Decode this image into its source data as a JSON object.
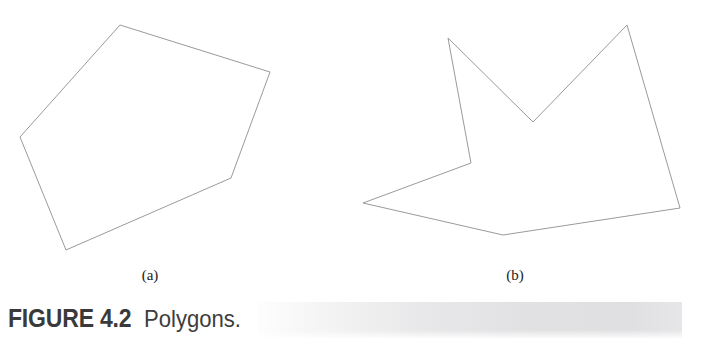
{
  "figure": {
    "caption_label": "FIGURE 4.2",
    "caption_text": "Polygons.",
    "line_color": "#9a9a9a",
    "line_width": 1,
    "background_color": "#ffffff",
    "band_color": "#e4e4e6"
  },
  "panels": [
    {
      "id": "a",
      "label": "(a)",
      "name": "convex-polygon",
      "vertex_count": 5,
      "points": "120,25 270,72 231,178 66,250 20,137",
      "vertices": [
        {
          "x": 120,
          "y": 25
        },
        {
          "x": 270,
          "y": 72
        },
        {
          "x": 231,
          "y": 178
        },
        {
          "x": 66,
          "y": 250
        },
        {
          "x": 20,
          "y": 137
        }
      ]
    },
    {
      "id": "b",
      "label": "(b)",
      "name": "concave-polygon",
      "vertex_count": 7,
      "points": "448,38 533,122 627,25 680,208 503,235 363,203 471,163",
      "vertices": [
        {
          "x": 448,
          "y": 38
        },
        {
          "x": 533,
          "y": 122
        },
        {
          "x": 627,
          "y": 25
        },
        {
          "x": 680,
          "y": 208
        },
        {
          "x": 503,
          "y": 235
        },
        {
          "x": 363,
          "y": 203
        },
        {
          "x": 471,
          "y": 163
        }
      ]
    }
  ],
  "chart_data": {
    "type": "diagram",
    "subtitle": "",
    "xlabel": "",
    "ylabel": "",
    "grid": false,
    "legend": "none",
    "shapes": [
      {
        "name": "(a)",
        "kind": "polygon",
        "closed": true,
        "convex": true,
        "vertices": [
          [
            120,
            25
          ],
          [
            270,
            72
          ],
          [
            231,
            178
          ],
          [
            66,
            250
          ],
          [
            20,
            137
          ]
        ]
      },
      {
        "name": "(b)",
        "kind": "polygon",
        "closed": true,
        "convex": false,
        "vertices": [
          [
            448,
            38
          ],
          [
            533,
            122
          ],
          [
            627,
            25
          ],
          [
            680,
            208
          ],
          [
            503,
            235
          ],
          [
            363,
            203
          ],
          [
            471,
            163
          ]
        ]
      }
    ]
  }
}
